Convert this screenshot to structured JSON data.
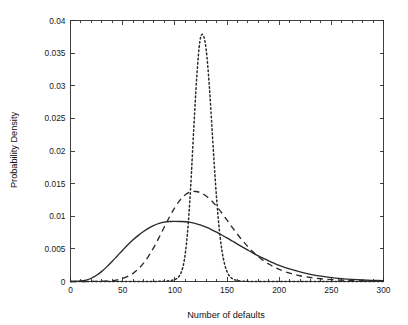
{
  "chart_data": {
    "type": "line",
    "title": "",
    "xlabel": "Number of defaults",
    "ylabel": "Probability Density",
    "xlim": [
      0,
      300
    ],
    "ylim": [
      0,
      0.04
    ],
    "grid": false,
    "legend": "none",
    "x_ticks": [
      "0",
      "50",
      "100",
      "150",
      "200",
      "250",
      "300"
    ],
    "x_tick_values": [
      0,
      50,
      100,
      150,
      200,
      250,
      300
    ],
    "y_ticks": [
      "0",
      "0.005",
      "0.01",
      "0.015",
      "0.02",
      "0.025",
      "0.03",
      "0.035",
      "0.04"
    ],
    "y_tick_values": [
      0,
      0.005,
      0.01,
      0.015,
      0.02,
      0.025,
      0.03,
      0.035,
      0.04
    ],
    "minor_x_ticks": true,
    "series": [
      {
        "name": "solid",
        "style": "solid",
        "color": "#2a2a2a",
        "peak_x": 112,
        "peak_y": 0.0092,
        "x": [
          0,
          5,
          10,
          15,
          20,
          25,
          30,
          35,
          40,
          45,
          50,
          55,
          60,
          65,
          70,
          75,
          80,
          85,
          90,
          95,
          100,
          105,
          110,
          115,
          120,
          125,
          130,
          135,
          140,
          145,
          150,
          155,
          160,
          165,
          170,
          175,
          180,
          185,
          190,
          195,
          200,
          210,
          220,
          230,
          240,
          250,
          260,
          270,
          280,
          290,
          300
        ],
        "values": [
          0.0,
          2e-05,
          8e-05,
          0.00022,
          0.0005,
          0.00095,
          0.00155,
          0.00228,
          0.0031,
          0.00395,
          0.0048,
          0.00562,
          0.00638,
          0.00707,
          0.00767,
          0.00818,
          0.00859,
          0.0089,
          0.0091,
          0.0092,
          0.00922,
          0.0092,
          0.00916,
          0.00906,
          0.00888,
          0.00863,
          0.00832,
          0.00796,
          0.00756,
          0.00713,
          0.00668,
          0.00621,
          0.00574,
          0.00527,
          0.00481,
          0.00436,
          0.00393,
          0.00353,
          0.00315,
          0.0028,
          0.00248,
          0.00192,
          0.00146,
          0.0011,
          0.00082,
          0.0006,
          0.00044,
          0.00032,
          0.00023,
          0.00017,
          0.00012
        ]
      },
      {
        "name": "dashed",
        "style": "dashed",
        "color": "#2a2a2a",
        "peak_x": 124,
        "peak_y": 0.0138,
        "x": [
          0,
          10,
          20,
          30,
          40,
          45,
          50,
          55,
          60,
          65,
          70,
          75,
          80,
          85,
          90,
          95,
          100,
          105,
          110,
          115,
          120,
          125,
          130,
          135,
          140,
          145,
          150,
          155,
          160,
          165,
          170,
          175,
          180,
          185,
          190,
          195,
          200,
          210,
          220,
          230,
          240,
          250,
          260,
          270,
          280,
          290,
          300
        ],
        "values": [
          0.0,
          0.0,
          1e-05,
          4e-05,
          0.00014,
          0.00026,
          0.00046,
          0.00078,
          0.00125,
          0.00192,
          0.00281,
          0.00394,
          0.00528,
          0.00679,
          0.00838,
          0.00993,
          0.01133,
          0.01248,
          0.01329,
          0.01372,
          0.0138,
          0.01358,
          0.0131,
          0.0124,
          0.01152,
          0.0105,
          0.0094,
          0.0083,
          0.00724,
          0.00624,
          0.00533,
          0.00452,
          0.00381,
          0.0032,
          0.00268,
          0.00223,
          0.00186,
          0.00128,
          0.00088,
          0.00061,
          0.00042,
          0.00029,
          0.0002,
          0.00014,
          0.0001,
          7e-05,
          5e-05
        ]
      },
      {
        "name": "dotted",
        "style": "dotted",
        "color": "#2a2a2a",
        "peak_x": 127,
        "peak_y": 0.0378,
        "x": [
          0,
          60,
          80,
          90,
          95,
          100,
          103,
          106,
          109,
          112,
          115,
          118,
          121,
          124,
          127,
          130,
          133,
          136,
          139,
          142,
          145,
          148,
          151,
          154,
          157,
          160,
          165,
          170,
          180,
          200,
          220,
          250,
          300
        ],
        "values": [
          0.0,
          0.0,
          1e-05,
          5e-05,
          0.00012,
          0.0003,
          0.0006,
          0.00135,
          0.0032,
          0.0072,
          0.014,
          0.023,
          0.0313,
          0.0368,
          0.0378,
          0.0356,
          0.0301,
          0.0225,
          0.015,
          0.009,
          0.0049,
          0.00248,
          0.0012,
          0.00058,
          0.00028,
          0.00014,
          5e-05,
          2e-05,
          1e-05,
          0.0,
          0.0,
          0.0,
          0.0
        ]
      }
    ]
  },
  "axes": {
    "x_title": "Number of defaults",
    "y_title": "Probability Density"
  }
}
